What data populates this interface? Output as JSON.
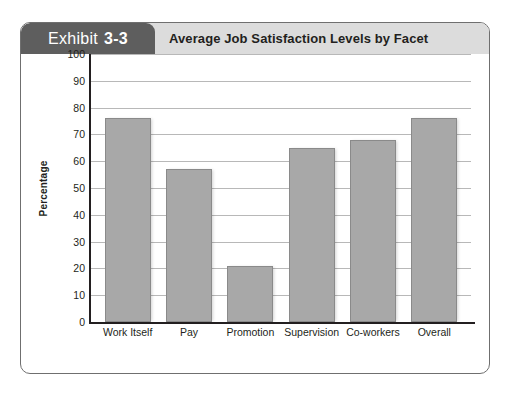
{
  "exhibit": {
    "tab_word": "Exhibit",
    "tab_number": "3-3",
    "title": "Average Job Satisfaction Levels by Facet"
  },
  "colors": {
    "tab_background": "#5e5e5e",
    "header_band": "#dcdcdc",
    "bar_fill": "#a8a8a8",
    "bar_border": "#8a8a8a",
    "gridline": "#b8b8b8",
    "axis": "#231f20"
  },
  "chart_data": {
    "type": "bar",
    "title": "Average Job Satisfaction Levels by Facet",
    "xlabel": "",
    "ylabel": "Percentage",
    "ylim": [
      0,
      100
    ],
    "yticks": [
      100,
      90,
      80,
      70,
      60,
      50,
      40,
      30,
      20,
      10,
      0
    ],
    "grid": true,
    "legend": false,
    "categories": [
      "Work Itself",
      "Pay",
      "Promotion",
      "Supervision",
      "Co-workers",
      "Overall"
    ],
    "values": [
      76,
      57,
      21,
      65,
      68,
      76
    ]
  }
}
